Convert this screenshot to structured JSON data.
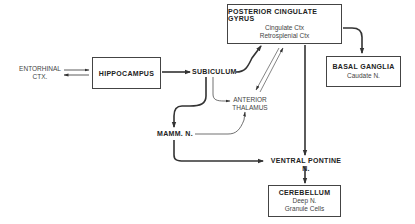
{
  "diagram": {
    "nodes": {
      "entorhinal": {
        "line1": "ENTORHINAL",
        "line2": "CTX."
      },
      "hippocampus": {
        "title": "HIPPOCAMPUS"
      },
      "subiculum": {
        "label": "SUBICULUM"
      },
      "posterior_cingulate": {
        "title": "POSTERIOR CINGULATE GYRUS",
        "sub1": "Cingulate Ctx",
        "sub2": "Retrosplenial Ctx"
      },
      "basal_ganglia": {
        "title": "BASAL GANGLIA",
        "sub1": "Caudate N."
      },
      "anterior_thalamus": {
        "line1": "ANTERIOR",
        "line2": "THALAMUS"
      },
      "mamm_n": {
        "label": "MAMM. N."
      },
      "ventral_pontine": {
        "label": "VENTRAL PONTINE N."
      },
      "cerebellum": {
        "title": "CEREBELLUM",
        "sub1": "Deep N.",
        "sub2": "Granule Cells"
      }
    },
    "edges": [
      {
        "from": "entorhinal",
        "to": "hippocampus",
        "bidirectional": true
      },
      {
        "from": "hippocampus",
        "to": "subiculum",
        "weight": "heavy"
      },
      {
        "from": "subiculum",
        "to": "posterior_cingulate",
        "weight": "heavy"
      },
      {
        "from": "subiculum",
        "to": "anterior_thalamus",
        "weight": "light"
      },
      {
        "from": "subiculum",
        "to": "mamm_n",
        "weight": "heavy"
      },
      {
        "from": "mamm_n",
        "to": "anterior_thalamus",
        "weight": "light"
      },
      {
        "from": "mamm_n",
        "to": "ventral_pontine",
        "weight": "heavy"
      },
      {
        "from": "anterior_thalamus",
        "to": "posterior_cingulate",
        "bidirectional": true,
        "weight": "light"
      },
      {
        "from": "posterior_cingulate",
        "to": "basal_ganglia",
        "weight": "heavy"
      },
      {
        "from": "posterior_cingulate",
        "to": "ventral_pontine",
        "weight": "heavy"
      },
      {
        "from": "ventral_pontine",
        "to": "cerebellum",
        "weight": "heavy"
      }
    ],
    "colors": {
      "line": "#333333",
      "text": "#222222",
      "background": "#ffffff"
    }
  }
}
